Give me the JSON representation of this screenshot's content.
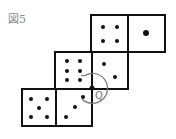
{
  "figure": {
    "caption": "図5",
    "point_label": "Q",
    "colors": {
      "ink": "#111111",
      "arc": "#777777",
      "caption": "#8a8a8a"
    }
  },
  "faces": [
    {
      "name": "face-four",
      "pips": 4,
      "row": "top",
      "col": 1
    },
    {
      "name": "face-one",
      "pips": 1,
      "row": "top",
      "col": 2
    },
    {
      "name": "face-six",
      "pips": 6,
      "row": "middle",
      "col": 0
    },
    {
      "name": "face-two",
      "pips": 2,
      "row": "middle",
      "col": 1
    },
    {
      "name": "face-five",
      "pips": 5,
      "row": "bottom",
      "col": 0
    },
    {
      "name": "face-three",
      "pips": 3,
      "row": "bottom",
      "col": 1
    }
  ]
}
